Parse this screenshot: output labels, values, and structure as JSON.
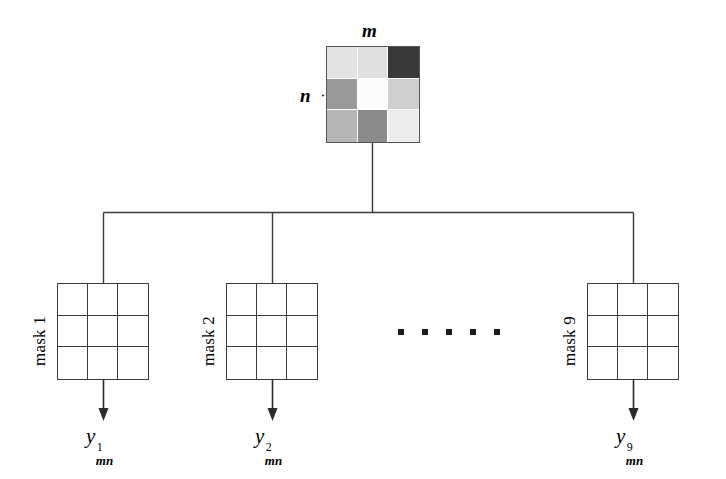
{
  "figure": {
    "type": "block-diagram"
  },
  "source": {
    "name": "source-pixel-grid",
    "rows": 3,
    "cols": 3,
    "axis_labels": {
      "horizontal": "m",
      "vertical": "n"
    },
    "cells": [
      {
        "id": "r1c1",
        "shade": "#e3e3e3"
      },
      {
        "id": "r1c2",
        "shade": "#e0e0e0"
      },
      {
        "id": "r1c3",
        "shade": "#383838"
      },
      {
        "id": "r2c1",
        "shade": "#9a9a9a"
      },
      {
        "id": "r2c2",
        "shade": "#fbfbfb"
      },
      {
        "id": "r2c3",
        "shade": "#cfcfcf"
      },
      {
        "id": "r3c1",
        "shade": "#b6b6b6"
      },
      {
        "id": "r3c2",
        "shade": "#8c8c8c"
      },
      {
        "id": "r3c3",
        "shade": "#ededed"
      }
    ]
  },
  "masks": [
    {
      "label": "mask 1",
      "output_base": "y",
      "output_sub": "mn",
      "output_sup": "1"
    },
    {
      "label": "mask 2",
      "output_base": "y",
      "output_sub": "mn",
      "output_sup": "2"
    },
    {
      "label": "mask 9",
      "output_base": "y",
      "output_sub": "mn",
      "output_sup": "9"
    }
  ],
  "ellipsis": {
    "label": "continuation-dots",
    "count": 5
  },
  "colors": {
    "stroke": "#3a3a3a",
    "source_border": "#555555",
    "text": "#000000",
    "background": "#ffffff"
  }
}
